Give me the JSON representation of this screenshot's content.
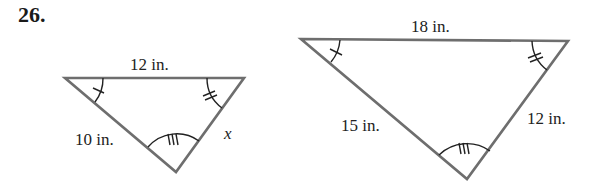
{
  "problem": {
    "number": "26."
  },
  "triangles": [
    {
      "id": "small",
      "sides": {
        "top": "12 in.",
        "left": "10 in.",
        "right": "x"
      },
      "angle_marks": {
        "top_left": 1,
        "top_right": 2,
        "bottom": 3
      }
    },
    {
      "id": "large",
      "sides": {
        "top": "18 in.",
        "left": "15 in.",
        "right": "12 in."
      },
      "angle_marks": {
        "top_left": 1,
        "top_right": 2,
        "bottom": 3
      }
    }
  ],
  "colors": {
    "edge": "#6e6e6e",
    "text": "#222222"
  }
}
